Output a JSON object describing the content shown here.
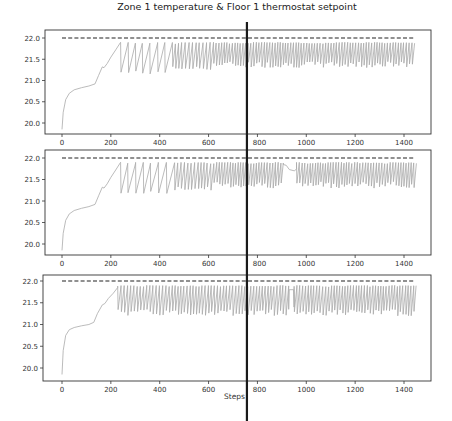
{
  "chart_data": [
    {
      "type": "line",
      "title": "Zone 1 temperature & Floor 1 thermostat setpoint",
      "xlabel": "",
      "ylabel": "",
      "x_ticks": [
        0,
        200,
        400,
        600,
        800,
        1000,
        1200,
        1400
      ],
      "y_ticks": [
        "20.0",
        "20.5",
        "21.0",
        "21.5",
        "22.0"
      ],
      "xlim": [
        -70,
        1520
      ],
      "ylim": [
        19.75,
        22.1
      ],
      "grid": false,
      "series": [
        {
          "name": "Floor 1 thermostat setpoint",
          "style": "dashed",
          "color": "#222222",
          "x": [
            0,
            1440
          ],
          "values": [
            22.0,
            22.0
          ]
        },
        {
          "name": "Zone 1 temperature",
          "style": "solid",
          "color": "#a9a9a9",
          "warmup_x": [
            0,
            5,
            15,
            30,
            50,
            80,
            110,
            135,
            150,
            165,
            172,
            185,
            200,
            220,
            240
          ],
          "warmup_y": [
            19.85,
            20.25,
            20.55,
            20.7,
            20.78,
            20.83,
            20.87,
            20.92,
            21.12,
            21.32,
            21.3,
            21.4,
            21.55,
            21.72,
            21.9
          ],
          "oscillation": {
            "start": 240,
            "end": 1440,
            "high": 21.9,
            "low_early": 21.15,
            "low_late": 21.3,
            "period_early": 30,
            "period_late": 10
          },
          "flat_segment": null
        }
      ],
      "annotation": {
        "vertical_line_step": 757
      }
    },
    {
      "type": "line",
      "title": "",
      "x_ticks": [
        0,
        200,
        400,
        600,
        800,
        1000,
        1200,
        1400
      ],
      "y_ticks": [
        "20.0",
        "20.5",
        "21.0",
        "21.5",
        "22.0"
      ],
      "ylim": [
        19.75,
        22.1
      ],
      "series": [
        {
          "name": "Floor 1 thermostat setpoint",
          "style": "dashed",
          "color": "#222222",
          "x": [
            0,
            1440
          ],
          "values": [
            22.0,
            22.0
          ]
        },
        {
          "name": "Zone 1 temperature",
          "style": "solid",
          "color": "#a9a9a9",
          "warmup_x": [
            0,
            5,
            15,
            30,
            50,
            80,
            110,
            135,
            150,
            165,
            172,
            185,
            200,
            220,
            240
          ],
          "warmup_y": [
            19.85,
            20.25,
            20.55,
            20.7,
            20.78,
            20.83,
            20.87,
            20.92,
            21.12,
            21.32,
            21.3,
            21.4,
            21.55,
            21.72,
            21.9
          ],
          "oscillation": {
            "start": 240,
            "end": 1440,
            "high": 21.9,
            "low_early": 21.15,
            "low_late": 21.3,
            "period_early": 30,
            "period_late": 10
          },
          "flat_segment": {
            "start": 905,
            "end": 960,
            "hump": true,
            "level": 21.75
          }
        }
      ],
      "annotation": {
        "vertical_line_step": 757
      }
    },
    {
      "type": "line",
      "title": "",
      "xlabel": "Steps",
      "x_ticks": [
        0,
        200,
        400,
        600,
        800,
        1000,
        1200,
        1400
      ],
      "y_ticks": [
        "20.0",
        "20.5",
        "21.0",
        "21.5",
        "22.0"
      ],
      "ylim": [
        19.75,
        22.1
      ],
      "series": [
        {
          "name": "Floor 1 thermostat setpoint",
          "style": "dashed",
          "color": "#222222",
          "x": [
            0,
            1440
          ],
          "values": [
            22.0,
            22.0
          ]
        },
        {
          "name": "Zone 1 temperature",
          "style": "solid",
          "color": "#a9a9a9",
          "warmup_x": [
            0,
            5,
            15,
            30,
            50,
            80,
            110,
            130,
            145,
            165,
            175,
            190,
            210,
            228
          ],
          "warmup_y": [
            19.85,
            20.4,
            20.75,
            20.88,
            20.93,
            20.97,
            21.0,
            21.05,
            21.25,
            21.45,
            21.48,
            21.6,
            21.72,
            21.85
          ],
          "oscillation": {
            "start": 228,
            "end": 1440,
            "high": 21.9,
            "low_early": 21.2,
            "low_late": 21.3,
            "period_early": 12,
            "period_late": 10
          },
          "flat_segment": {
            "start": 920,
            "end": 950,
            "hump": false,
            "level": 21.8
          }
        }
      ],
      "annotation": {
        "vertical_line_step": 757
      }
    }
  ],
  "figure": {
    "title": "Zone 1 temperature & Floor 1 thermostat setpoint",
    "xlabel": "Steps",
    "caption": "Figure 3: ..."
  },
  "colors": {
    "temperature": "#a9a9a9",
    "setpoint": "#222222",
    "vline": "#1a1a1a",
    "axes": "#333333"
  }
}
